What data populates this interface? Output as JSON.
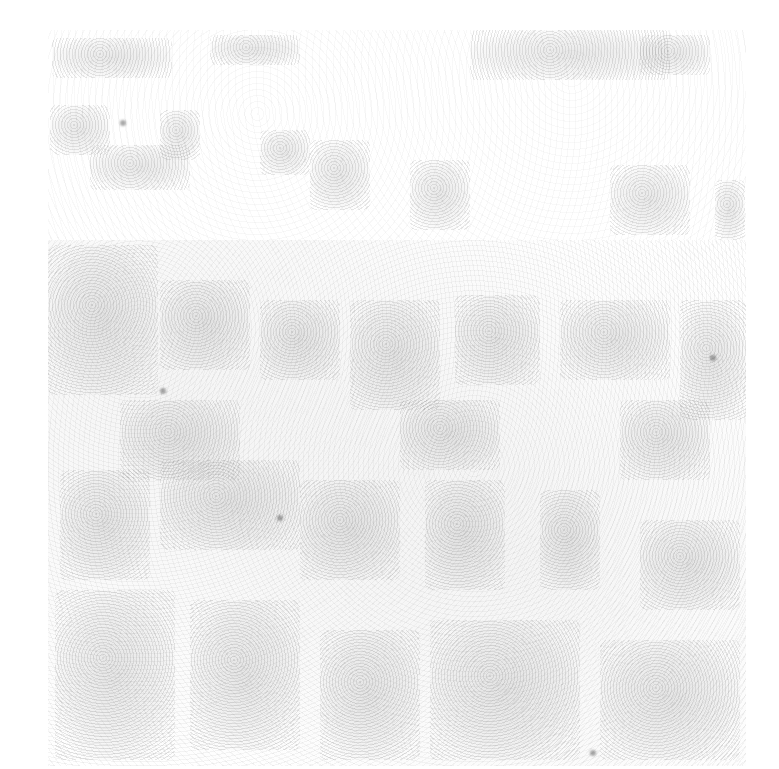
{
  "image": {
    "description": "Faded grayscale noise texture with blocky light-gray patches; no legible text or UI elements",
    "width": 779,
    "height": 769,
    "background_color": "#ffffff",
    "texture_color": "#9a9a9a",
    "textured_region": {
      "left": 48,
      "top": 30,
      "right": 746,
      "bottom": 766
    }
  }
}
